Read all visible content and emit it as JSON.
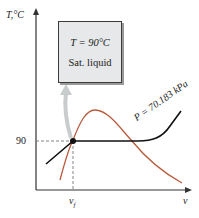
{
  "axes": {
    "y_label": "T,°C",
    "x_label": "v",
    "y_tick": "90",
    "x_tick": "v_f",
    "x_tick_main": "v",
    "x_tick_sub": "f"
  },
  "state_box": {
    "line1": "T = 90°C",
    "line2": "Sat. liquid"
  },
  "isobar_label": "P = 70.183 kPa",
  "colors": {
    "dome": "#b85a3c",
    "isobar": "#111111",
    "axis": "#333333",
    "box_fill": "#e6e8e9",
    "arrow": "#c8cccd"
  }
}
